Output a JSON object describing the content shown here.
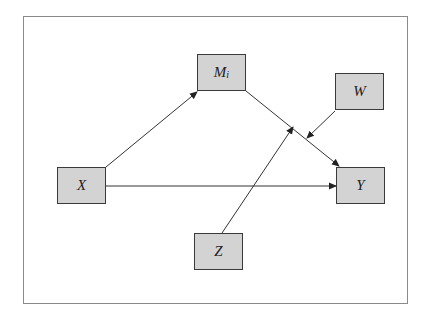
{
  "diagram": {
    "type": "moderated-mediation-path-diagram",
    "frame": {
      "stroke": "#8a8a8a"
    },
    "node_fill": "#d3d3d3",
    "node_stroke": "#3a3a3a",
    "nodes": [
      {
        "id": "X",
        "label": "X",
        "sub": "",
        "x": 57,
        "y": 167
      },
      {
        "id": "M",
        "label": "M",
        "sub": "i",
        "x": 197,
        "y": 54
      },
      {
        "id": "W",
        "label": "W",
        "sub": "",
        "x": 335,
        "y": 73
      },
      {
        "id": "Y",
        "label": "Y",
        "sub": "",
        "x": 336,
        "y": 167
      },
      {
        "id": "Z",
        "label": "Z",
        "sub": "",
        "x": 194,
        "y": 233
      }
    ],
    "edges": [
      {
        "from": "X",
        "to": "M_i",
        "description": "X predicts mediator M_i"
      },
      {
        "from": "M_i",
        "to": "Y",
        "description": "mediator predicts Y"
      },
      {
        "from": "X",
        "to": "Y",
        "description": "direct effect"
      },
      {
        "from": "W",
        "to": "M_i→Y path",
        "description": "W moderates M_i→Y path"
      },
      {
        "from": "Z",
        "to": "M_i→Y path",
        "description": "Z moderates M_i→Y path"
      }
    ]
  }
}
